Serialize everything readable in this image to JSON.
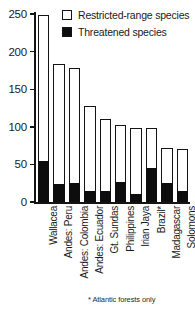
{
  "chart_data": {
    "type": "bar",
    "title": "",
    "subtitle": "",
    "xlabel": "",
    "ylabel": "",
    "ylim": [
      0,
      250
    ],
    "yticks": [
      0,
      50,
      100,
      150,
      200,
      250
    ],
    "grid": false,
    "stacked": true,
    "legend_position": "top-right",
    "categories": [
      "Wallacea",
      "Andes: Peru",
      "Andes: Colombia",
      "Andes: Ecuador",
      "Gt. Sundas",
      "Philippines",
      "Irian Jaya",
      "Brazil*",
      "Madagascar",
      "Solomons"
    ],
    "series": [
      {
        "name": "Restricted-range species",
        "color": "#ffffff",
        "values": [
          249,
          183,
          178,
          128,
          110,
          103,
          98,
          98,
          72,
          70
        ]
      },
      {
        "name": "Threatened species",
        "color": "#0d0d0d",
        "values": [
          55,
          24,
          25,
          15,
          15,
          27,
          11,
          45,
          25,
          14
        ]
      }
    ],
    "annotations": [
      "* Atlantic forests only"
    ]
  },
  "legend": {
    "items": [
      {
        "label": "Restricted-range species",
        "swatch": "open"
      },
      {
        "label": "Threatened species",
        "swatch": "filled"
      }
    ]
  },
  "axis": {
    "y_tick_labels": [
      "250",
      "200",
      "150",
      "100",
      "50",
      "0"
    ]
  },
  "footnote": "* Atlantic forests only",
  "colors": {
    "ink": "#141414",
    "fill_threatened": "#0d0d0d",
    "fill_restricted": "#ffffff",
    "background": "#ffffff"
  }
}
